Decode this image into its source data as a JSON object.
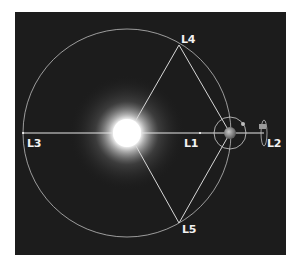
{
  "diagram": {
    "background_color": "#1c1c1c",
    "line_color": "#d8d8d8",
    "bodies": [
      {
        "name": "Sun",
        "color": "#ffffff"
      },
      {
        "name": "Earth",
        "color": "#8a8a8a"
      },
      {
        "name": "Moon",
        "color": "#bdbdbd"
      }
    ],
    "points": [
      {
        "id": "L1",
        "label": "L1"
      },
      {
        "id": "L2",
        "label": "L2"
      },
      {
        "id": "L3",
        "label": "L3"
      },
      {
        "id": "L4",
        "label": "L4"
      },
      {
        "id": "L5",
        "label": "L5"
      }
    ]
  }
}
